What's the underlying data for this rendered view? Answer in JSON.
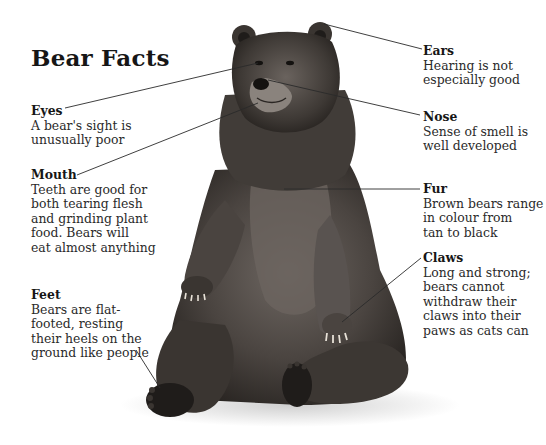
{
  "title": "Bear Facts",
  "labels": {
    "eyes": {
      "heading": "Eyes",
      "text": "A bear's sight is\nunusually poor"
    },
    "mouth": {
      "heading": "Mouth",
      "text": "Teeth are good for\nboth tearing flesh\nand grinding plant\nfood. Bears will\neat almost anything"
    },
    "feet": {
      "heading": "Feet",
      "text": "Bears are flat-\nfooted, resting\ntheir heels on the\nground like people"
    },
    "ears": {
      "heading": "Ears",
      "text": "Hearing is not\nespecially good"
    },
    "nose": {
      "heading": "Nose",
      "text": "Sense of smell is\nwell developed"
    },
    "fur": {
      "heading": "Fur",
      "text": "Brown bears range\nin colour from\ntan to black"
    },
    "claws": {
      "heading": "Claws",
      "text": "Long and strong;\nbears cannot\nwithdraw their\nclaws into their\npaws as cats can"
    }
  },
  "colors": {
    "fur_dark": "#2e2a27",
    "fur_mid": "#5a5450",
    "fur_light": "#8a8480",
    "line": "#2a2a2a",
    "shadow": "#d9d9d9"
  }
}
